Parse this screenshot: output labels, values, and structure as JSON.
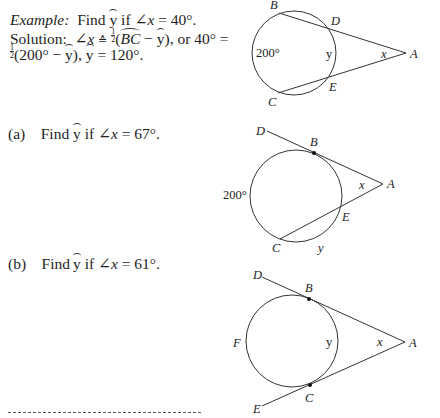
{
  "example": {
    "label": "Example:",
    "line1_rest": "Find",
    "y_var": "y",
    "if": "if",
    "angle_sym": "∠",
    "x_var": "x",
    "equals_value": "= 40°.",
    "solution_label": "Solution:",
    "solution_approx": "≙",
    "half_num": "1",
    "half_den": "2",
    "arc_bc": "BC",
    "minus": "−",
    "or_40": "), or 40° =",
    "line3_a": "(200° −",
    "line3_b": "), ",
    "line3_c": "= 120°."
  },
  "problems": [
    {
      "label": "(a)",
      "prefix": "Find",
      "y_var": "y",
      "if": "if",
      "angle": "∠",
      "x_var": "x",
      "value": "= 67°."
    },
    {
      "label": "(b)",
      "prefix": "Find",
      "y_var": "y",
      "if": "if",
      "angle": "∠",
      "x_var": "x",
      "value": "= 61°."
    }
  ],
  "diagrams": [
    {
      "name": "example-diagram",
      "labels": {
        "B": "B",
        "D": "D",
        "A": "A",
        "E": "E",
        "C": "C",
        "arc_big": "200°",
        "arc_small": "y",
        "angle": "x"
      }
    },
    {
      "name": "problem-a-diagram",
      "labels": {
        "D": "D",
        "B": "B",
        "A": "A",
        "E": "E",
        "C": "C",
        "arc_big": "200°",
        "arc_small": "y",
        "angle": "x"
      }
    },
    {
      "name": "problem-b-diagram",
      "labels": {
        "D": "D",
        "B": "B",
        "A": "A",
        "F": "F",
        "C": "C",
        "E": "E",
        "arc_small": "y",
        "angle": "x"
      }
    }
  ]
}
